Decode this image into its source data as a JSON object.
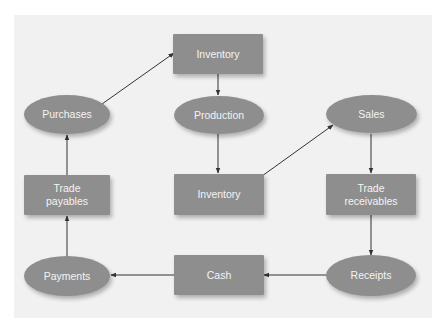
{
  "diagram": {
    "title": "",
    "colors": {
      "panel": "#f1f1f1",
      "node_fill": "#8e8e8e",
      "node_text": "#f4f4f4",
      "arrow": "#333333"
    },
    "nodes": [
      {
        "id": "inventory_top",
        "shape": "rect",
        "label": "Inventory"
      },
      {
        "id": "purchases",
        "shape": "ellipse",
        "label": "Purchases"
      },
      {
        "id": "production",
        "shape": "ellipse",
        "label": "Production"
      },
      {
        "id": "sales",
        "shape": "ellipse",
        "label": "Sales"
      },
      {
        "id": "trade_payables",
        "shape": "rect",
        "label": "Trade\npayables"
      },
      {
        "id": "inventory_mid",
        "shape": "rect",
        "label": "Inventory"
      },
      {
        "id": "trade_receivables",
        "shape": "rect",
        "label": "Trade\nreceivables"
      },
      {
        "id": "payments",
        "shape": "ellipse",
        "label": "Payments"
      },
      {
        "id": "cash",
        "shape": "rect",
        "label": "Cash"
      },
      {
        "id": "receipts",
        "shape": "ellipse",
        "label": "Receipts"
      }
    ],
    "edges": [
      {
        "from": "purchases",
        "to": "inventory_top"
      },
      {
        "from": "inventory_top",
        "to": "production"
      },
      {
        "from": "production",
        "to": "inventory_mid"
      },
      {
        "from": "inventory_mid",
        "to": "sales"
      },
      {
        "from": "sales",
        "to": "trade_receivables"
      },
      {
        "from": "trade_receivables",
        "to": "receipts"
      },
      {
        "from": "receipts",
        "to": "cash"
      },
      {
        "from": "cash",
        "to": "payments"
      },
      {
        "from": "payments",
        "to": "trade_payables"
      },
      {
        "from": "trade_payables",
        "to": "purchases"
      }
    ]
  }
}
